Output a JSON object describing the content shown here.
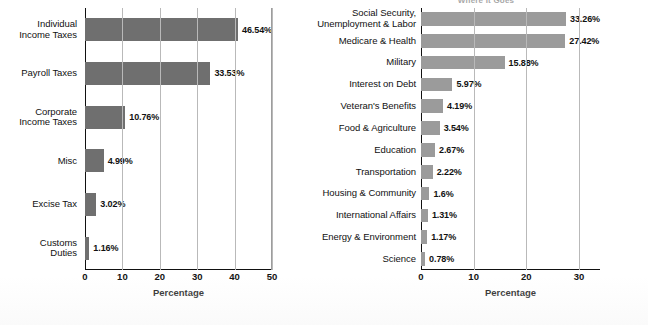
{
  "figure": {
    "background_color": "#ffffff",
    "axis_color": "#111111",
    "gridline_color": "#b9b9b9"
  },
  "charts": [
    {
      "id": "where-it-comes-from",
      "title": "",
      "bar_color": "#6f6f6f",
      "xlabel": "Percentage",
      "xticks": [
        "0",
        "10",
        "20",
        "30",
        "40",
        "50"
      ],
      "xlim": [
        0,
        50
      ],
      "categories": [
        "Individual\nIncome Taxes",
        "Payroll Taxes",
        "Corporate\nIncome Taxes",
        "Misc",
        "Excise Tax",
        "Customs\nDuties"
      ],
      "category_lines": [
        [
          "Individual",
          "Income Taxes"
        ],
        [
          "Payroll Taxes"
        ],
        [
          "Corporate",
          "Income Taxes"
        ],
        [
          "Misc"
        ],
        [
          "Excise Tax"
        ],
        [
          "Customs",
          "Duties"
        ]
      ],
      "values": [
        46.54,
        33.53,
        10.76,
        4.99,
        3.02,
        1.16
      ],
      "value_labels": [
        "46.54%",
        "33.53%",
        "10.76%",
        "4.99%",
        "3.02%",
        "1.16%"
      ]
    },
    {
      "id": "where-it-goes",
      "title": "Where It Goes",
      "bar_color": "#9b9b9b",
      "xlabel": "Percentage",
      "xticks": [
        "0",
        "10",
        "20",
        "30"
      ],
      "xlim": [
        0,
        34
      ],
      "categories": [
        "Social Security,\nUnemployment & Labor",
        "Medicare & Health",
        "Military",
        "Interest on Debt",
        "Veteran's Benefits",
        "Food & Agriculture",
        "Education",
        "Transportation",
        "Housing & Community",
        "International Affairs",
        "Energy & Environment",
        "Science"
      ],
      "category_lines": [
        [
          "Social Security,",
          "Unemployment & Labor"
        ],
        [
          "Medicare & Health"
        ],
        [
          "Military"
        ],
        [
          "Interest on Debt"
        ],
        [
          "Veteran's Benefits"
        ],
        [
          "Food & Agriculture"
        ],
        [
          "Education"
        ],
        [
          "Transportation"
        ],
        [
          "Housing & Community"
        ],
        [
          "International Affairs"
        ],
        [
          "Energy & Environment"
        ],
        [
          "Science"
        ]
      ],
      "values": [
        33.26,
        27.42,
        15.88,
        5.97,
        4.19,
        3.54,
        2.67,
        2.22,
        1.6,
        1.31,
        1.17,
        0.78
      ],
      "value_labels": [
        "33.26%",
        "27.42%",
        "15.88%",
        "5.97%",
        "4.19%",
        "3.54%",
        "2.67%",
        "2.22%",
        "1.6%",
        "1.31%",
        "1.17%",
        "0.78%"
      ]
    }
  ],
  "chart_data": [
    {
      "type": "bar",
      "orientation": "horizontal",
      "title": "",
      "xlabel": "Percentage",
      "ylabel": "",
      "xlim": [
        0,
        50
      ],
      "xticks": [
        0,
        10,
        20,
        30,
        40,
        50
      ],
      "grid": "vertical",
      "legend": "none",
      "bar_color": "#6f6f6f",
      "categories": [
        "Individual Income Taxes",
        "Payroll Taxes",
        "Corporate Income Taxes",
        "Misc",
        "Excise Tax",
        "Customs Duties"
      ],
      "values": [
        46.54,
        33.53,
        10.76,
        4.99,
        3.02,
        1.16
      ],
      "data_labels": [
        "46.54%",
        "33.53%",
        "10.76%",
        "4.99%",
        "3.02%",
        "1.16%"
      ]
    },
    {
      "type": "bar",
      "orientation": "horizontal",
      "title": "Where It Goes",
      "xlabel": "Percentage",
      "ylabel": "",
      "xlim": [
        0,
        34
      ],
      "xticks": [
        0,
        10,
        20,
        30
      ],
      "grid": "vertical",
      "legend": "none",
      "bar_color": "#9b9b9b",
      "categories": [
        "Social Security, Unemployment & Labor",
        "Medicare & Health",
        "Military",
        "Interest on Debt",
        "Veteran's Benefits",
        "Food & Agriculture",
        "Education",
        "Transportation",
        "Housing & Community",
        "International Affairs",
        "Energy & Environment",
        "Science"
      ],
      "values": [
        33.26,
        27.42,
        15.88,
        5.97,
        4.19,
        3.54,
        2.67,
        2.22,
        1.6,
        1.31,
        1.17,
        0.78
      ],
      "data_labels": [
        "33.26%",
        "27.42%",
        "15.88%",
        "5.97%",
        "4.19%",
        "3.54%",
        "2.67%",
        "2.22%",
        "1.6%",
        "1.31%",
        "1.17%",
        "0.78%"
      ]
    }
  ]
}
